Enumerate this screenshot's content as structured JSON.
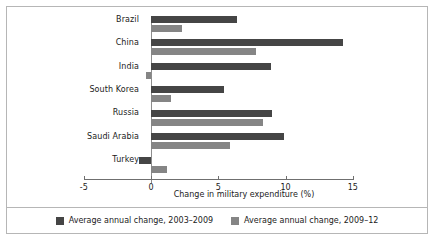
{
  "chart_data": {
    "type": "bar",
    "orientation": "horizontal",
    "title": "",
    "xlabel": "Change in military expenditure (%)",
    "ylabel": "",
    "xlim": [
      -5,
      15
    ],
    "xticks": [
      -5,
      0,
      5,
      10,
      15
    ],
    "xtick_labels": [
      "-5",
      "0",
      "5",
      "10",
      "15"
    ],
    "grid": false,
    "legend_position": "bottom",
    "categories": [
      "Brazil",
      "China",
      "India",
      "South Korea",
      "Russia",
      "Saudi Arabia",
      "Turkey"
    ],
    "series": [
      {
        "name": "Average annual change, 2003–2009",
        "color": "#454545",
        "values": [
          6.4,
          14.3,
          8.9,
          5.4,
          9.0,
          9.9,
          -0.9
        ]
      },
      {
        "name": "Average annual change, 2009–12",
        "color": "#858585",
        "values": [
          2.3,
          7.8,
          -0.4,
          1.5,
          8.3,
          5.9,
          1.2
        ]
      }
    ]
  },
  "legend": {
    "items": [
      {
        "label": "Average annual change, 2003–2009"
      },
      {
        "label": "Average annual change, 2009–12"
      }
    ]
  },
  "axis": {
    "x_title": "Change in military expenditure (%)",
    "tick_labels": [
      "-5",
      "0",
      "5",
      "10",
      "15"
    ]
  },
  "colors": {
    "series_0": "#454545",
    "series_1": "#858585",
    "border": "#b6b6b6",
    "axis": "#6f6f6f",
    "text": "#1b1b1b",
    "background": "#ffffff"
  }
}
